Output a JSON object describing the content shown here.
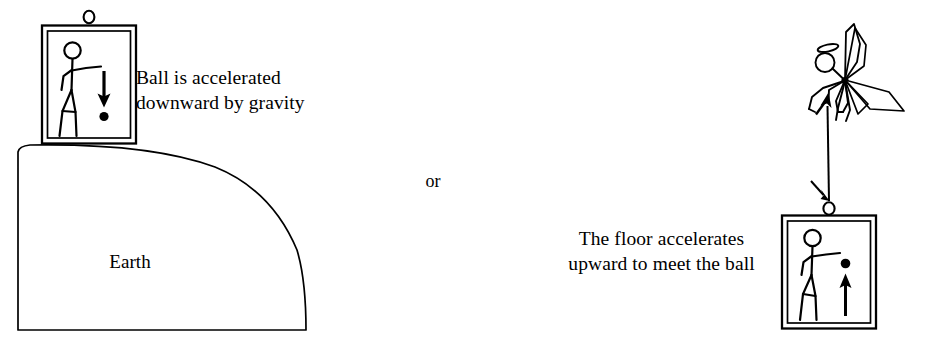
{
  "figure": {
    "background_color": "#ffffff",
    "ink_color": "#000000",
    "width": 927,
    "height": 341
  },
  "left_panel": {
    "caption_line1": "Ball is accelerated",
    "caption_line2": "downward by gravity",
    "ground_label": "Earth",
    "elevator": {
      "name": "elevator-car-on-earth",
      "ball_arrow_direction": "down",
      "has_hook_ring": true,
      "occupant": "stick-figure-person"
    }
  },
  "connector": {
    "label": "or"
  },
  "right_panel": {
    "caption_line1": "The floor accelerates",
    "caption_line2": "upward to meet the ball",
    "elevator": {
      "name": "elevator-car-lifted",
      "ball_arrow_direction": "up",
      "has_hook_ring": true,
      "occupant": "stick-figure-person"
    },
    "lifter": {
      "name": "angel-figure",
      "has_halo": true,
      "has_wings": true,
      "rope_arrow_top_direction": "up",
      "rope_arrow_bottom_direction": "down"
    }
  }
}
